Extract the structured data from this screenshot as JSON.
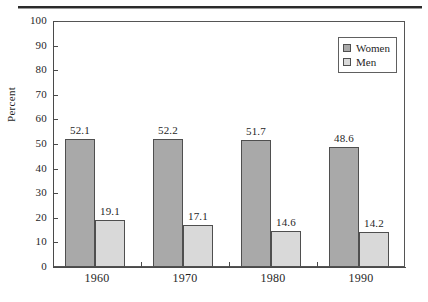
{
  "chart_data": {
    "type": "bar",
    "title": "",
    "subtitle": "",
    "xlabel": "",
    "ylabel": "Percent",
    "categories": [
      "1960",
      "1970",
      "1980",
      "1990"
    ],
    "series": [
      {
        "name": "Women",
        "values": [
          52.1,
          52.2,
          51.7,
          48.6
        ],
        "color": "#a9a9a9"
      },
      {
        "name": "Men",
        "values": [
          19.1,
          17.1,
          14.6,
          14.2
        ],
        "color": "#d9d9d9"
      }
    ],
    "ylim": [
      0,
      100
    ],
    "ytick_step": 10,
    "ytick_labels": [
      "0",
      "10",
      "20",
      "30",
      "40",
      "50",
      "60",
      "70",
      "80",
      "90",
      "100"
    ],
    "grid": false,
    "legend_position": "top-right",
    "data_labels_shown": true,
    "bar_outline_color": "#4f4f4f",
    "axis_color": "#4a4a4a",
    "background": "#ffffff"
  },
  "legend": {
    "entries": [
      {
        "label": "Women"
      },
      {
        "label": "Men"
      }
    ]
  },
  "axes": {
    "y_title": "Percent"
  }
}
